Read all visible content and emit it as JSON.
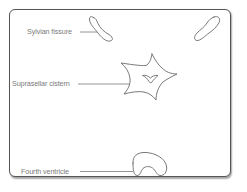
{
  "diagram": {
    "title": "",
    "frame": {
      "border_color": "#555555",
      "background": "#ffffff"
    },
    "stroke_color": "#6a6a6a",
    "label_color": "#7a7a7a",
    "labels": [
      {
        "id": "sylvian-fissure",
        "text": "Sylvian fissure",
        "x": 27,
        "y": 29
      },
      {
        "id": "suprasellar-cistern",
        "text": "Suprasellar cistern",
        "x": 12,
        "y": 81
      },
      {
        "id": "fourth-ventricle",
        "text": "Fourth ventricle",
        "x": 21,
        "y": 169
      }
    ],
    "structures": [
      {
        "id": "sylvian-fissure-left",
        "name": "Left Sylvian fissure"
      },
      {
        "id": "sylvian-fissure-right",
        "name": "Right Sylvian fissure"
      },
      {
        "id": "suprasellar-cistern",
        "name": "Suprasellar cistern (star shape)"
      },
      {
        "id": "fourth-ventricle",
        "name": "Fourth ventricle (kidney shape)"
      }
    ]
  }
}
